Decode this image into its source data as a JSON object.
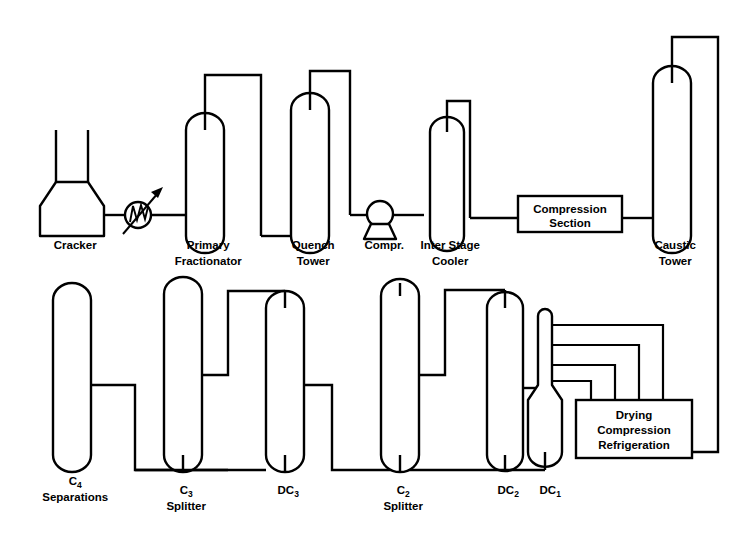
{
  "diagram": {
    "type": "process-flow-diagram",
    "background_color": "#ffffff",
    "line_color": "#000000",
    "units": [
      {
        "id": "cracker",
        "label_line1": "Cracker",
        "label_line2": "",
        "shape": "furnace",
        "label_x": 72,
        "label_y": 249
      },
      {
        "id": "primary-fractionator",
        "label_line1": "Primary",
        "label_line2": "Fractionator",
        "shape": "column",
        "label_x": 205,
        "label_y": 249
      },
      {
        "id": "quench-tower",
        "label_line1": "Quench",
        "label_line2": "Tower",
        "shape": "column",
        "label_x": 310,
        "label_y": 249
      },
      {
        "id": "compressor",
        "label_line1": "Compr.",
        "label_line2": "",
        "shape": "centrifugal-compressor",
        "label_x": 380,
        "label_y": 249
      },
      {
        "id": "inter-stage-cooler",
        "label_line1": "Inter Stage",
        "label_line2": "Cooler",
        "shape": "column",
        "label_x": 447,
        "label_y": 249
      },
      {
        "id": "compression-section",
        "label_line1": "Compression",
        "label_line2": "Section",
        "shape": "rectangle-box",
        "label_x": 570,
        "label_y": 214
      },
      {
        "id": "caustic-tower",
        "label_line1": "Caustic",
        "label_line2": "Tower",
        "shape": "column",
        "label_x": 672,
        "label_y": 249
      },
      {
        "id": "c4-separations",
        "label_line1": "C",
        "label_sub1": "4",
        "label_line2": "Separations",
        "shape": "column",
        "label_x": 72,
        "label_y": 495
      },
      {
        "id": "c3-splitter",
        "label_line1": "C",
        "label_sub1": "3",
        "label_line2": "Splitter",
        "shape": "column",
        "label_x": 183,
        "label_y": 495
      },
      {
        "id": "dc3",
        "label_line1": "DC",
        "label_sub1": "3",
        "label_line2": "",
        "shape": "column",
        "label_x": 285,
        "label_y": 495
      },
      {
        "id": "c2-splitter",
        "label_line1": "C",
        "label_sub1": "2",
        "label_line2": "Splitter",
        "shape": "column",
        "label_x": 400,
        "label_y": 495
      },
      {
        "id": "dc2",
        "label_line1": "DC",
        "label_sub1": "2",
        "label_line2": "",
        "shape": "column",
        "label_x": 505,
        "label_y": 495
      },
      {
        "id": "dc1",
        "label_line1": "DC",
        "label_sub1": "1",
        "label_line2": "",
        "shape": "necked-column",
        "label_x": 545,
        "label_y": 495
      },
      {
        "id": "drying-compression-refrigeration",
        "label_line1": "Drying",
        "label_line2": "Compression",
        "label_line3": "Refrigeration",
        "shape": "rectangle-box",
        "label_x": 640,
        "label_y": 424
      }
    ],
    "equipment_symbols": [
      {
        "id": "heat-exchanger",
        "type": "coil-exchanger-with-arrow",
        "cx": 138,
        "cy": 215,
        "r": 13
      }
    ]
  }
}
